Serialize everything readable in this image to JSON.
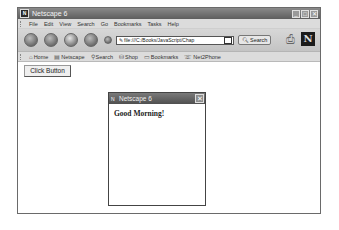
{
  "window": {
    "title": "Netscape 6",
    "app_icon": "N",
    "controls": {
      "minimize": "_",
      "maximize": "□",
      "close": "✕"
    }
  },
  "menubar": {
    "items": [
      "File",
      "Edit",
      "View",
      "Search",
      "Go",
      "Bookmarks",
      "Tasks",
      "Help"
    ]
  },
  "navbar": {
    "url": "file:///C:/Books/JavaScript/Chap",
    "search_label": "Search",
    "logo": "N"
  },
  "personal_toolbar": {
    "items": [
      {
        "label": "Home",
        "icon": "home-icon"
      },
      {
        "label": "Netscape",
        "icon": "netscape-icon"
      },
      {
        "label": "Search",
        "icon": "search-icon"
      },
      {
        "label": "Shop",
        "icon": "shop-icon"
      },
      {
        "label": "Bookmarks",
        "icon": "bookmarks-icon"
      },
      {
        "label": "Net2Phone",
        "icon": "phone-icon"
      }
    ]
  },
  "content": {
    "button_label": "Click Button"
  },
  "popup": {
    "title": "Netscape 6",
    "app_icon": "N",
    "close": "✕",
    "message": "Good Morning!"
  }
}
